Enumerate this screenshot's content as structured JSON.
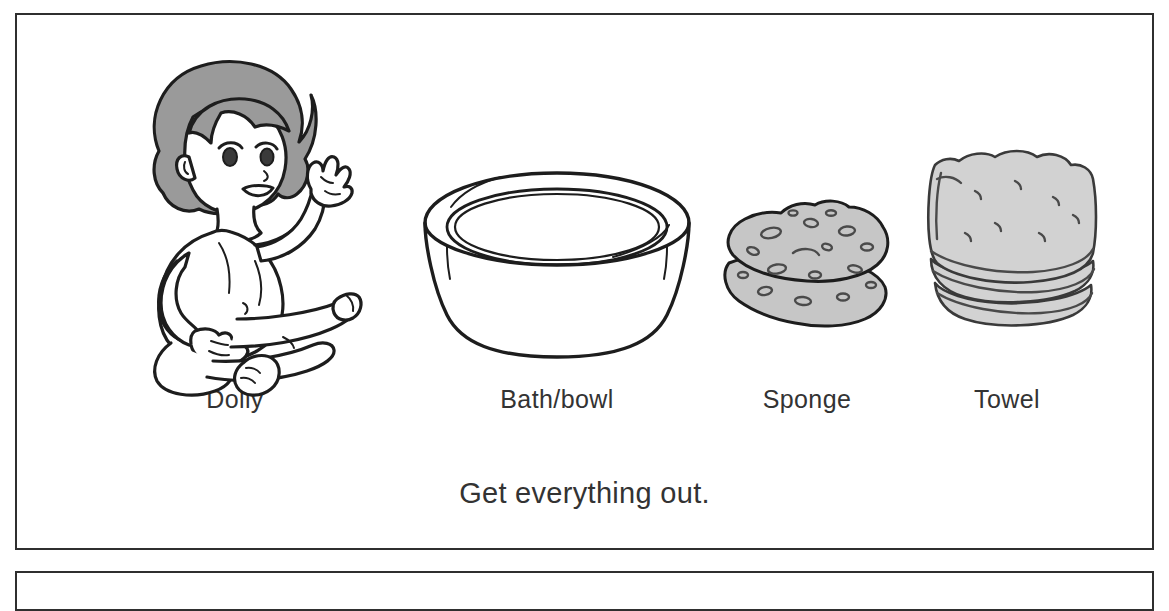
{
  "page": {
    "background_color": "#ffffff",
    "border_color": "#2f2f2f"
  },
  "panel": {
    "caption": "Get everything out."
  },
  "items": [
    {
      "label": "Dolly",
      "icon": "baby-doll-figure",
      "color": "#9a9a9a"
    },
    {
      "label": "Bath/bowl",
      "icon": "bath-basin",
      "color": "#ffffff"
    },
    {
      "label": "Sponge",
      "icon": "sponge",
      "color": "#c6c6c6"
    },
    {
      "label": "Towel",
      "icon": "folded-towel",
      "color": "#d2d2d2"
    }
  ]
}
